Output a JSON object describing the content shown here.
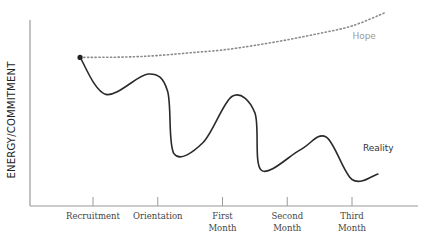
{
  "chart_data": {
    "type": "line",
    "title": "",
    "xlabel": "",
    "ylabel": "ENERGY/COMMITMENT",
    "grid": false,
    "legend": "inline-labels",
    "x_categories": [
      {
        "lines": [
          "Recruitment"
        ]
      },
      {
        "lines": [
          "Orientation"
        ]
      },
      {
        "lines": [
          "First",
          "Month"
        ]
      },
      {
        "lines": [
          "Second",
          "Month"
        ]
      },
      {
        "lines": [
          "Third",
          "Month"
        ]
      }
    ],
    "xlim": [
      -0.8,
      5.0
    ],
    "ylim": [
      0,
      10
    ],
    "series": [
      {
        "name": "Hope",
        "label": "Hope",
        "style": "dotted",
        "color": "#8a8a8a",
        "points": [
          [
            -0.2,
            7.6
          ],
          [
            0.5,
            7.62
          ],
          [
            1.0,
            7.7
          ],
          [
            1.5,
            7.85
          ],
          [
            2.0,
            8.0
          ],
          [
            2.5,
            8.25
          ],
          [
            3.0,
            8.55
          ],
          [
            3.5,
            8.9
          ],
          [
            4.0,
            9.3
          ],
          [
            4.5,
            10.0
          ]
        ]
      },
      {
        "name": "Reality",
        "label": "Reality",
        "style": "solid",
        "color": "#2a2a2a",
        "start_marker": true,
        "points": [
          [
            -0.2,
            7.6
          ],
          [
            0.2,
            5.6
          ],
          [
            0.85,
            6.7
          ],
          [
            1.15,
            5.8
          ],
          [
            1.25,
            2.4
          ],
          [
            1.7,
            3.0
          ],
          [
            2.15,
            5.5
          ],
          [
            2.5,
            4.6
          ],
          [
            2.6,
            1.5
          ],
          [
            3.2,
            2.6
          ],
          [
            3.6,
            3.3
          ],
          [
            4.0,
            1.0
          ],
          [
            4.4,
            1.3
          ]
        ]
      }
    ]
  }
}
